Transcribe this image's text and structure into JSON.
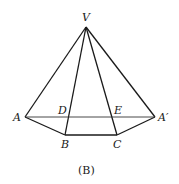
{
  "caption": "(B)",
  "points": {
    "V": {
      "label": "V",
      "x": 86,
      "y": 27
    },
    "A": {
      "label": "A",
      "x": 25,
      "y": 117
    },
    "A_prime": {
      "label": "A′",
      "x": 155,
      "y": 117
    },
    "B": {
      "label": "B",
      "x": 65,
      "y": 135
    },
    "C": {
      "label": "C",
      "x": 117,
      "y": 135
    },
    "D": {
      "label": "D",
      "x": 69,
      "y": 117
    },
    "E": {
      "label": "E",
      "x": 111,
      "y": 117
    }
  },
  "segments": [
    [
      "V",
      "A"
    ],
    [
      "V",
      "B"
    ],
    [
      "V",
      "C"
    ],
    [
      "V",
      "A_prime"
    ],
    [
      "A",
      "B"
    ],
    [
      "B",
      "C"
    ],
    [
      "C",
      "A_prime"
    ],
    [
      "A",
      "A_prime"
    ]
  ],
  "colors": {
    "stroke": "#1a1a1a",
    "background": "#ffffff"
  }
}
